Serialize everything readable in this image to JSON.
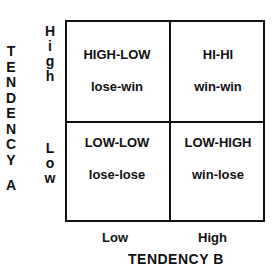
{
  "y_axis": {
    "title_letters": [
      "T",
      "E",
      "N",
      "D",
      "E",
      "N",
      "C",
      "Y",
      " ",
      "A"
    ],
    "title": "TENDENCY A",
    "ticks": [
      {
        "label_letters": [
          "H",
          "i",
          "g",
          "h"
        ],
        "label": "High"
      },
      {
        "label_letters": [
          "L",
          "o",
          "w"
        ],
        "label": "Low"
      }
    ]
  },
  "x_axis": {
    "title": "TENDENCY B",
    "ticks": [
      "Low",
      "High"
    ]
  },
  "cells": [
    {
      "position": "top-left",
      "title": "HIGH-LOW",
      "outcome": "lose-win"
    },
    {
      "position": "top-right",
      "title": "HI-HI",
      "outcome": "win-win"
    },
    {
      "position": "bottom-left",
      "title": "LOW-LOW",
      "outcome": "lose-lose"
    },
    {
      "position": "bottom-right",
      "title": "LOW-HIGH",
      "outcome": "win-lose"
    }
  ]
}
